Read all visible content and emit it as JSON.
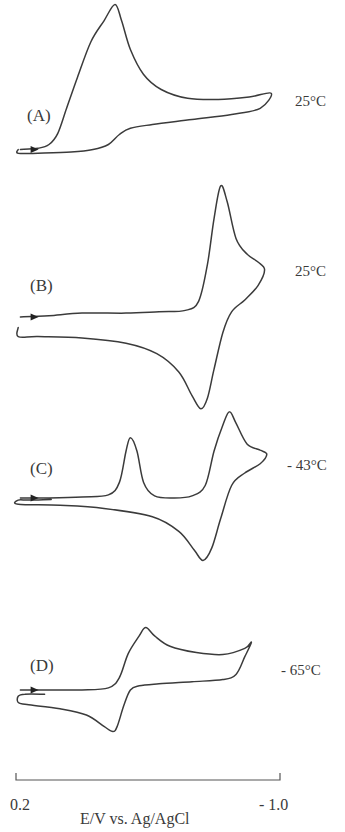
{
  "chart_data": {
    "type": "line",
    "title": "",
    "xlabel": "E/V  vs.  Ag/AgCl",
    "ylabel": "",
    "xlim": [
      0.2,
      -1.0
    ],
    "x_tick_labels": [
      "0.2",
      "- 1.0"
    ],
    "grid": false,
    "legend": "none",
    "current_units": "arbitrary (cathodic up)",
    "panels": [
      {
        "label": "(A)",
        "temperature": "25°C",
        "points": [
          [
            0.18,
            0.02
          ],
          [
            0.1,
            0.03
          ],
          [
            0.05,
            0.06
          ],
          [
            0.01,
            0.15
          ],
          [
            -0.03,
            0.35
          ],
          [
            -0.08,
            0.6
          ],
          [
            -0.14,
            0.88
          ],
          [
            -0.2,
            1.05
          ],
          [
            -0.25,
            1.18
          ],
          [
            -0.28,
            1.05
          ],
          [
            -0.32,
            0.82
          ],
          [
            -0.38,
            0.62
          ],
          [
            -0.46,
            0.5
          ],
          [
            -0.58,
            0.43
          ],
          [
            -0.72,
            0.42
          ],
          [
            -0.86,
            0.44
          ],
          [
            -0.96,
            0.47
          ],
          [
            -0.91,
            0.35
          ],
          [
            -0.78,
            0.3
          ],
          [
            -0.6,
            0.26
          ],
          [
            -0.42,
            0.22
          ],
          [
            -0.32,
            0.19
          ],
          [
            -0.27,
            0.14
          ],
          [
            -0.22,
            0.06
          ],
          [
            -0.15,
            0.02
          ],
          [
            -0.05,
            0.0
          ],
          [
            0.1,
            -0.01
          ],
          [
            0.19,
            -0.01
          ],
          [
            0.19,
            0.02
          ]
        ]
      },
      {
        "label": "(B)",
        "temperature": "25°C",
        "points": [
          [
            0.18,
            0.0
          ],
          [
            0.05,
            0.01
          ],
          [
            -0.1,
            0.03
          ],
          [
            -0.3,
            0.03
          ],
          [
            -0.45,
            0.04
          ],
          [
            -0.57,
            0.05
          ],
          [
            -0.63,
            0.12
          ],
          [
            -0.67,
            0.4
          ],
          [
            -0.7,
            0.75
          ],
          [
            -0.73,
            1.0
          ],
          [
            -0.76,
            0.88
          ],
          [
            -0.8,
            0.6
          ],
          [
            -0.85,
            0.48
          ],
          [
            -0.9,
            0.42
          ],
          [
            -0.93,
            0.36
          ],
          [
            -0.9,
            0.24
          ],
          [
            -0.84,
            0.13
          ],
          [
            -0.78,
            0.04
          ],
          [
            -0.74,
            -0.12
          ],
          [
            -0.7,
            -0.4
          ],
          [
            -0.67,
            -0.62
          ],
          [
            -0.64,
            -0.7
          ],
          [
            -0.6,
            -0.6
          ],
          [
            -0.54,
            -0.42
          ],
          [
            -0.44,
            -0.28
          ],
          [
            -0.3,
            -0.2
          ],
          [
            -0.1,
            -0.16
          ],
          [
            0.1,
            -0.15
          ],
          [
            0.19,
            -0.15
          ],
          [
            0.19,
            -0.08
          ]
        ]
      },
      {
        "label": "(C)",
        "temperature": "- 43°C",
        "points": [
          [
            0.18,
            0.0
          ],
          [
            0.05,
            0.0
          ],
          [
            -0.1,
            0.01
          ],
          [
            -0.22,
            0.03
          ],
          [
            -0.27,
            0.15
          ],
          [
            -0.3,
            0.45
          ],
          [
            -0.32,
            0.58
          ],
          [
            -0.35,
            0.45
          ],
          [
            -0.38,
            0.15
          ],
          [
            -0.43,
            0.02
          ],
          [
            -0.52,
            0.0
          ],
          [
            -0.6,
            0.02
          ],
          [
            -0.66,
            0.12
          ],
          [
            -0.7,
            0.45
          ],
          [
            -0.74,
            0.7
          ],
          [
            -0.77,
            0.83
          ],
          [
            -0.8,
            0.72
          ],
          [
            -0.85,
            0.52
          ],
          [
            -0.91,
            0.46
          ],
          [
            -0.94,
            0.42
          ],
          [
            -0.91,
            0.33
          ],
          [
            -0.84,
            0.24
          ],
          [
            -0.78,
            0.12
          ],
          [
            -0.73,
            -0.2
          ],
          [
            -0.69,
            -0.48
          ],
          [
            -0.65,
            -0.6
          ],
          [
            -0.61,
            -0.5
          ],
          [
            -0.54,
            -0.32
          ],
          [
            -0.42,
            -0.18
          ],
          [
            -0.2,
            -0.1
          ],
          [
            0.0,
            -0.07
          ],
          [
            0.19,
            -0.06
          ],
          [
            0.19,
            -0.02
          ],
          [
            0.14,
            -0.02
          ],
          [
            0.04,
            -0.015
          ]
        ]
      },
      {
        "label": "(D)",
        "temperature": "- 65°C",
        "points": [
          [
            0.18,
            0.0
          ],
          [
            0.05,
            0.0
          ],
          [
            -0.1,
            0.0
          ],
          [
            -0.22,
            0.02
          ],
          [
            -0.27,
            0.12
          ],
          [
            -0.31,
            0.35
          ],
          [
            -0.36,
            0.52
          ],
          [
            -0.39,
            0.6
          ],
          [
            -0.43,
            0.52
          ],
          [
            -0.5,
            0.42
          ],
          [
            -0.62,
            0.36
          ],
          [
            -0.74,
            0.34
          ],
          [
            -0.84,
            0.4
          ],
          [
            -0.87,
            0.46
          ],
          [
            -0.84,
            0.32
          ],
          [
            -0.8,
            0.15
          ],
          [
            -0.74,
            0.1
          ],
          [
            -0.6,
            0.08
          ],
          [
            -0.45,
            0.06
          ],
          [
            -0.36,
            0.04
          ],
          [
            -0.32,
            0.0
          ],
          [
            -0.29,
            -0.15
          ],
          [
            -0.26,
            -0.35
          ],
          [
            -0.24,
            -0.4
          ],
          [
            -0.2,
            -0.35
          ],
          [
            -0.12,
            -0.24
          ],
          [
            0.0,
            -0.18
          ],
          [
            0.15,
            -0.14
          ],
          [
            0.19,
            -0.12
          ],
          [
            0.19,
            -0.06
          ],
          [
            0.16,
            -0.04
          ],
          [
            0.07,
            -0.04
          ]
        ]
      }
    ]
  }
}
